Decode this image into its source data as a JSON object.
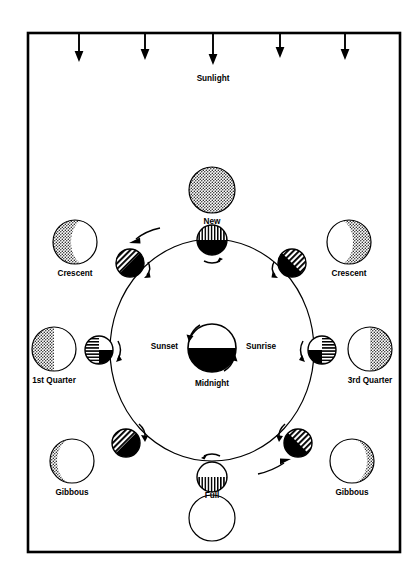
{
  "figure": {
    "frame": {
      "x": 28,
      "y": 33,
      "width": 372,
      "height": 519
    }
  },
  "sunlight": {
    "label": "Sunlight",
    "label_x": 213,
    "label_y": 79,
    "direction": "downward",
    "ray_count": 5,
    "rays": [
      {
        "x": 79,
        "y_start": 34,
        "y_end": 60
      },
      {
        "x": 145,
        "y_start": 34,
        "y_end": 58
      },
      {
        "x": 213,
        "y_start": 34,
        "y_end": 63
      },
      {
        "x": 280,
        "y_start": 34,
        "y_end": 56
      },
      {
        "x": 345,
        "y_start": 34,
        "y_end": 58
      }
    ]
  },
  "earth": {
    "name": "earth",
    "cx": 212,
    "cy": 348,
    "r": 24,
    "day_half": "top",
    "night_half": "bottom",
    "labels": {
      "sunset": "Sunset",
      "sunrise": "Sunrise",
      "midnight": "Midnight"
    },
    "label_positions": {
      "sunset": {
        "x": 178,
        "y": 347,
        "anchor": "end"
      },
      "sunrise": {
        "x": 246,
        "y": 347,
        "anchor": "start"
      },
      "midnight": {
        "x": 212,
        "y": 384,
        "anchor": "middle"
      }
    },
    "rotation_direction": "counterclockwise"
  },
  "orbit": {
    "cx": 212,
    "cy": 350,
    "rx": 102,
    "ry": 111,
    "direction": "counterclockwise",
    "direction_arrows": [
      {
        "name": "orbit-arrow-upper-left",
        "x": 142,
        "y": 235
      },
      {
        "name": "orbit-arrow-lower-right",
        "x": 278,
        "y": 467
      }
    ]
  },
  "orbit_moons": [
    {
      "name": "orbit-moon-new",
      "phase": "New",
      "cx": 212,
      "cy": 240,
      "r": 15,
      "lit_region": "top",
      "hatch": "vertical",
      "dark_region": "bottom",
      "spin_arrow": "below"
    },
    {
      "name": "orbit-moon-waxing-crescent",
      "phase": "Crescent",
      "cx": 130,
      "cy": 263,
      "r": 14,
      "lit_region": "upper-left",
      "hatch": "diagonal",
      "dark_region": "lower-right",
      "spin_arrow": "right"
    },
    {
      "name": "orbit-moon-first-quarter",
      "phase": "1st Quarter",
      "cx": 99,
      "cy": 350,
      "r": 14,
      "lit_region": "left",
      "hatch": "horizontal",
      "dark_region": "lower-right",
      "spin_arrow": "right"
    },
    {
      "name": "orbit-moon-waxing-gibbous",
      "phase": "Gibbous",
      "cx": 126,
      "cy": 443,
      "r": 14,
      "lit_region": "upper-left",
      "hatch": "diagonal",
      "dark_region": "lower-right",
      "spin_arrow": "above"
    },
    {
      "name": "orbit-moon-full",
      "phase": "Full",
      "cx": 212,
      "cy": 477,
      "r": 15,
      "lit_region": "bottom",
      "hatch": "vertical",
      "dark_region": "none",
      "spin_arrow": "above"
    },
    {
      "name": "orbit-moon-waning-gibbous",
      "phase": "Gibbous",
      "cx": 298,
      "cy": 443,
      "r": 14,
      "lit_region": "upper-right",
      "hatch": "diagonal",
      "dark_region": "lower-left",
      "spin_arrow": "above"
    },
    {
      "name": "orbit-moon-third-quarter",
      "phase": "3rd Quarter",
      "cx": 322,
      "cy": 350,
      "r": 14,
      "lit_region": "right",
      "hatch": "horizontal",
      "dark_region": "lower-left",
      "spin_arrow": "left"
    },
    {
      "name": "orbit-moon-waning-crescent",
      "phase": "Crescent",
      "cx": 292,
      "cy": 263,
      "r": 14,
      "lit_region": "upper-right",
      "hatch": "diagonal",
      "dark_region": "lower-left",
      "spin_arrow": "left"
    }
  ],
  "phase_views": [
    {
      "name": "phase-view-new",
      "label": "New",
      "cx": 212,
      "cy": 190,
      "r": 23,
      "label_x": 212,
      "label_y": 222,
      "appearance": "fully-shaded",
      "shade_fraction": 1.0,
      "lit_side": "none"
    },
    {
      "name": "phase-view-crescent-left",
      "label": "Crescent",
      "cx": 75,
      "cy": 242,
      "r": 22,
      "label_x": 75,
      "label_y": 274,
      "appearance": "shaded-with-thin-lit-edge",
      "shade_fraction": 0.85,
      "lit_side": "right"
    },
    {
      "name": "phase-view-first-quarter",
      "label": "1st Quarter",
      "cx": 54,
      "cy": 349,
      "r": 22,
      "label_x": 54,
      "label_y": 381,
      "appearance": "half-shaded",
      "shade_fraction": 0.5,
      "lit_side": "right"
    },
    {
      "name": "phase-view-gibbous-left",
      "label": "Gibbous",
      "cx": 72,
      "cy": 461,
      "r": 22,
      "label_x": 72,
      "label_y": 493,
      "appearance": "mostly-lit-thin-shaded-edge",
      "shade_fraction": 0.15,
      "lit_side": "right"
    },
    {
      "name": "phase-view-full",
      "label": "Full",
      "cx": 212,
      "cy": 518,
      "r": 23,
      "label_x": 212,
      "label_y": 496,
      "appearance": "fully-lit",
      "shade_fraction": 0.0,
      "lit_side": "all"
    },
    {
      "name": "phase-view-gibbous-right",
      "label": "Gibbous",
      "cx": 352,
      "cy": 461,
      "r": 22,
      "label_x": 352,
      "label_y": 493,
      "appearance": "mostly-lit-thin-shaded-edge",
      "shade_fraction": 0.15,
      "lit_side": "left"
    },
    {
      "name": "phase-view-third-quarter",
      "label": "3rd Quarter",
      "cx": 370,
      "cy": 349,
      "r": 22,
      "label_x": 370,
      "label_y": 381,
      "appearance": "half-shaded",
      "shade_fraction": 0.5,
      "lit_side": "left"
    },
    {
      "name": "phase-view-crescent-right",
      "label": "Crescent",
      "cx": 349,
      "cy": 242,
      "r": 22,
      "label_x": 349,
      "label_y": 274,
      "appearance": "shaded-with-thin-lit-edge",
      "shade_fraction": 0.85,
      "lit_side": "left"
    }
  ],
  "colors": {
    "ink": "#000000",
    "paper": "#ffffff"
  }
}
